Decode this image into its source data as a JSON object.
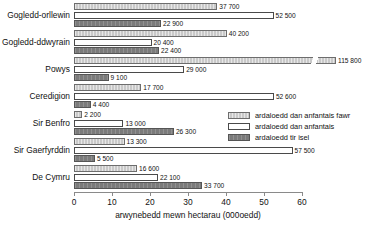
{
  "chart_data": {
    "type": "bar",
    "orientation": "horizontal",
    "title": "",
    "xlabel": "arwynebedd mewn hectarau (000oedd)",
    "ylabel": "",
    "xlim": [
      0,
      60
    ],
    "xticks": [
      0,
      10,
      20,
      30,
      40,
      50,
      60
    ],
    "xtick_labels": [
      "0",
      "10",
      "20",
      "30",
      "40",
      "50",
      "60"
    ],
    "grid": false,
    "legend_position": "middle-right",
    "value_unit": "hectares (thousands)",
    "note": "Powys 'ardaloedd dan anfantais fawr' bar is truncated with an axis-break slash; its value 115 800 exceeds the 60 axis maximum.",
    "categories": [
      "Gogledd-orllewin",
      "Gogledd-ddwyrain",
      "Powys",
      "Ceredigion",
      "Sir Benfro",
      "Sir Gaerfyrddin",
      "De Cymru"
    ],
    "series": [
      {
        "name": "ardaloedd dan anfantais fawr",
        "color": "#c9c9c9",
        "values": [
          37700,
          40200,
          115800,
          17700,
          2200,
          13300,
          16600
        ],
        "labels": [
          "37 700",
          "40 200",
          "115 800",
          "17 700",
          "2 200",
          "13 300",
          "16 600"
        ]
      },
      {
        "name": "ardaloedd dan anfantais",
        "color": "#ffffff",
        "values": [
          52500,
          20400,
          29000,
          52600,
          13000,
          57500,
          22100
        ],
        "labels": [
          "52 500",
          "20 400",
          "29 000",
          "52 600",
          "13 000",
          "57 500",
          "22 100"
        ]
      },
      {
        "name": "ardaloedd tir isel",
        "color": "#7b7b7b",
        "values": [
          22900,
          22400,
          9100,
          4400,
          26300,
          5500,
          33700
        ],
        "labels": [
          "22 900",
          "22 400",
          "9 100",
          "4 400",
          "26 300",
          "5 500",
          "33 700"
        ]
      }
    ]
  }
}
